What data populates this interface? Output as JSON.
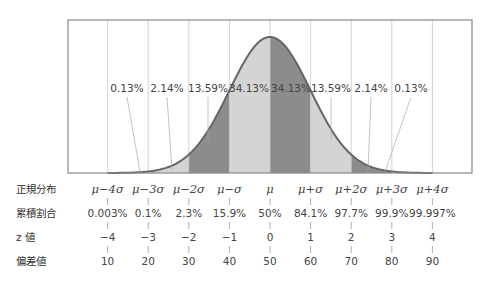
{
  "chart_data": {
    "type": "area",
    "title": "",
    "x": [
      -4,
      -3,
      -2,
      -1,
      0,
      1,
      2,
      3,
      4
    ],
    "region_percentages": [
      {
        "from": -4,
        "to": -3,
        "label": "0.13%",
        "shade": "none"
      },
      {
        "from": -3,
        "to": -2,
        "label": "2.14%",
        "shade": "light"
      },
      {
        "from": -2,
        "to": -1,
        "label": "13.59%",
        "shade": "dark"
      },
      {
        "from": -1,
        "to": 0,
        "label": "34.13%",
        "shade": "light"
      },
      {
        "from": 0,
        "to": 1,
        "label": "34.13%",
        "shade": "dark"
      },
      {
        "from": 1,
        "to": 2,
        "label": "13.59%",
        "shade": "light"
      },
      {
        "from": 2,
        "to": 3,
        "label": "2.14%",
        "shade": "dark"
      },
      {
        "from": 3,
        "to": 4,
        "label": "0.13%",
        "shade": "none"
      }
    ],
    "rows": {
      "normal_distribution": {
        "label": "正規分布",
        "values": [
          "μ−4σ",
          "μ−3σ",
          "μ−2σ",
          "μ−σ",
          "μ",
          "μ+σ",
          "μ+2σ",
          "μ+3σ",
          "μ+4σ"
        ]
      },
      "cumulative_ratio": {
        "label": "累積割合",
        "values": [
          "0.003%",
          "0.1%",
          "2.3%",
          "15.9%",
          "50%",
          "84.1%",
          "97.7%",
          "99.9%",
          "99.997%"
        ]
      },
      "z_value": {
        "label": "z 値",
        "values": [
          "−4",
          "−3",
          "−2",
          "−1",
          "0",
          "1",
          "2",
          "3",
          "4"
        ]
      },
      "deviation_value": {
        "label": "偏差値",
        "values": [
          "10",
          "20",
          "30",
          "40",
          "50",
          "60",
          "70",
          "80",
          "90"
        ]
      }
    },
    "xlim": [
      -5.4,
      5.0
    ],
    "grid": true,
    "colors": {
      "dark": "#8c8c8c",
      "light": "#d4d4d4",
      "curve": "#666666",
      "grid": "#c8c8c8",
      "frame": "#888888"
    }
  }
}
